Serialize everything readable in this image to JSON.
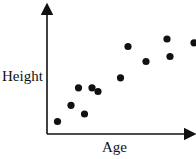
{
  "chart_data": {
    "type": "scatter",
    "title": "",
    "xlabel": "Age",
    "ylabel": "Height",
    "grid": false,
    "legend": null,
    "xlim": [
      0,
      10
    ],
    "ylim": [
      0,
      10
    ],
    "ticks": "none",
    "points": [
      {
        "x": 0.7,
        "y": 1.0
      },
      {
        "x": 1.6,
        "y": 2.3
      },
      {
        "x": 2.1,
        "y": 3.7
      },
      {
        "x": 2.5,
        "y": 1.6
      },
      {
        "x": 3.0,
        "y": 3.7
      },
      {
        "x": 3.4,
        "y": 3.4
      },
      {
        "x": 4.9,
        "y": 4.5
      },
      {
        "x": 5.4,
        "y": 7.0
      },
      {
        "x": 6.6,
        "y": 5.8
      },
      {
        "x": 8.0,
        "y": 7.6
      },
      {
        "x": 8.2,
        "y": 6.2
      },
      {
        "x": 9.8,
        "y": 7.3
      }
    ],
    "point_color": "#111111",
    "axis_color": "#111111",
    "trend": "positive correlation"
  }
}
